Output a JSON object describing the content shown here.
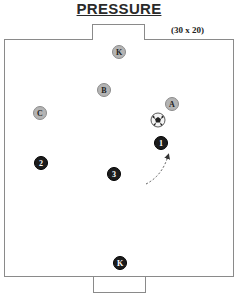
{
  "title": "PRESSURE",
  "dimensions_label": "(30 x 20)",
  "colors": {
    "attacker_fill": "#b4b4b4",
    "defender_fill": "#1c1c1c",
    "field_line": "#8a8a8a"
  },
  "attackers": [
    {
      "id": "keeper-top",
      "label": "K"
    },
    {
      "id": "b",
      "label": "B"
    },
    {
      "id": "c",
      "label": "C"
    },
    {
      "id": "a",
      "label": "A"
    }
  ],
  "defenders": [
    {
      "id": "one",
      "label": "1"
    },
    {
      "id": "two",
      "label": "2"
    },
    {
      "id": "three",
      "label": "3"
    },
    {
      "id": "keeper-bottom",
      "label": "K"
    }
  ],
  "ball": {
    "icon": "soccer-ball-icon"
  },
  "movement": {
    "description": "Defender 1 run toward ball (dashed arrow)",
    "style": "dashed"
  }
}
